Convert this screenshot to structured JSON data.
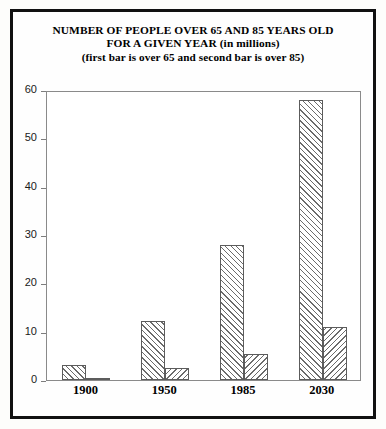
{
  "figure": {
    "title_lines": [
      "NUMBER OF PEOPLE OVER 65 AND 85 YEARS OLD",
      "FOR A GIVEN YEAR (in millions)",
      "(first bar is over 65 and second bar is over 85)"
    ]
  },
  "chart_data": {
    "type": "bar",
    "title": "NUMBER OF PEOPLE OVER 65 AND 85 YEARS OLD FOR A GIVEN YEAR (in millions)",
    "subtitle": "(first bar is over 65 and second bar is over 85)",
    "xlabel": "",
    "ylabel": "",
    "categories": [
      "1900",
      "1950",
      "1985",
      "2030"
    ],
    "series": [
      {
        "name": "over 65",
        "values": [
          3.1,
          12.3,
          28.0,
          58.0
        ]
      },
      {
        "name": "over 85",
        "values": [
          0.12,
          2.5,
          5.4,
          11.0
        ]
      }
    ],
    "ylim": [
      0,
      60
    ],
    "yticks": [
      0,
      10,
      20,
      30,
      40,
      50,
      60
    ],
    "ytick_labels": [
      "0",
      "10",
      "20",
      "30",
      "40",
      "50",
      "60"
    ],
    "grid": false,
    "legend": "none",
    "units": "millions"
  },
  "style": {
    "bar_fill": "#ffffff",
    "bar_edge": "#5c5c5c",
    "hatch_color": "#6b6b6b",
    "frame_color": "#111111",
    "axis_color": "#8a8a8a",
    "text_color": "#000000"
  }
}
